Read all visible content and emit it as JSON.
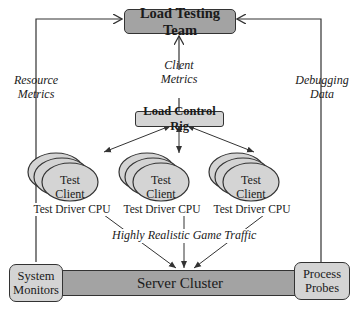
{
  "nodes": {
    "load_testing_team": "Load Testing Team",
    "load_control_rig": "Load Control Rig",
    "server_cluster": "Server Cluster",
    "system_monitors": [
      "System",
      "Monitors"
    ],
    "process_probes": [
      "Process",
      "Probes"
    ],
    "test_clients": [
      {
        "label": [
          "Test",
          "Client"
        ],
        "caption": "Test Driver CPU"
      },
      {
        "label": [
          "Test",
          "Client"
        ],
        "caption": "Test Driver CPU"
      },
      {
        "label": [
          "Test",
          "Client"
        ],
        "caption": "Test Driver CPU"
      }
    ]
  },
  "edges": {
    "resource_metrics": [
      "Resource",
      "Metrics"
    ],
    "client_metrics": [
      "Client",
      "Metrics"
    ],
    "debugging_data": [
      "Debugging",
      "Data"
    ],
    "game_traffic": "Highly Realistic Game Traffic"
  },
  "colors": {
    "dark_box": "#a3a3a3",
    "light_box": "#d4d4d4",
    "line": "#333333"
  }
}
